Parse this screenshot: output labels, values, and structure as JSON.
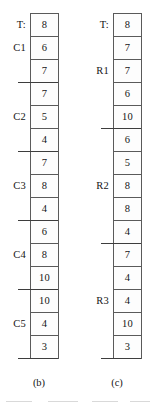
{
  "figure": {
    "panels": [
      {
        "id": "panel-b",
        "caption": "(b)",
        "header_label": "T:",
        "cells": [
          {
            "value": "8",
            "label": "T:",
            "group_end": false
          },
          {
            "value": "6",
            "label": "C1",
            "group_end": false
          },
          {
            "value": "7",
            "label": "",
            "group_end": true
          },
          {
            "value": "7",
            "label": "",
            "group_end": false
          },
          {
            "value": "5",
            "label": "C2",
            "group_end": false
          },
          {
            "value": "4",
            "label": "",
            "group_end": true
          },
          {
            "value": "7",
            "label": "",
            "group_end": false
          },
          {
            "value": "8",
            "label": "C3",
            "group_end": false
          },
          {
            "value": "4",
            "label": "",
            "group_end": true
          },
          {
            "value": "6",
            "label": "",
            "group_end": false
          },
          {
            "value": "8",
            "label": "C4",
            "group_end": false
          },
          {
            "value": "10",
            "label": "",
            "group_end": true
          },
          {
            "value": "10",
            "label": "",
            "group_end": false
          },
          {
            "value": "4",
            "label": "C5",
            "group_end": false
          },
          {
            "value": "3",
            "label": "",
            "group_end": true
          }
        ]
      },
      {
        "id": "panel-c",
        "caption": "(c)",
        "header_label": "T:",
        "cells": [
          {
            "value": "8",
            "label": "T:",
            "group_end": false
          },
          {
            "value": "7",
            "label": "",
            "group_end": false
          },
          {
            "value": "7",
            "label": "R1",
            "group_end": false
          },
          {
            "value": "6",
            "label": "",
            "group_end": false
          },
          {
            "value": "10",
            "label": "",
            "group_end": true
          },
          {
            "value": "6",
            "label": "",
            "group_end": false
          },
          {
            "value": "5",
            "label": "",
            "group_end": false
          },
          {
            "value": "8",
            "label": "R2",
            "group_end": false
          },
          {
            "value": "8",
            "label": "",
            "group_end": false
          },
          {
            "value": "4",
            "label": "",
            "group_end": true
          },
          {
            "value": "7",
            "label": "",
            "group_end": false
          },
          {
            "value": "4",
            "label": "",
            "group_end": false
          },
          {
            "value": "4",
            "label": "R3",
            "group_end": false
          },
          {
            "value": "10",
            "label": "",
            "group_end": false
          },
          {
            "value": "3",
            "label": "",
            "group_end": true
          }
        ]
      }
    ]
  },
  "chart_data": {
    "type": "table",
    "title": "",
    "xlabel": "",
    "ylabel": "",
    "panels": [
      {
        "name": "(b)",
        "column_header": "T:",
        "values": [
          8,
          6,
          7,
          7,
          5,
          4,
          7,
          8,
          4,
          6,
          8,
          10,
          10,
          4,
          3
        ],
        "group_labels": [
          "T:",
          "C1",
          "C2",
          "C3",
          "C4",
          "C5"
        ],
        "group_label_rows": [
          0,
          1,
          4,
          7,
          10,
          13
        ],
        "group_separator_after_rows": [
          2,
          5,
          8,
          11,
          14
        ],
        "groups": [
          {
            "label": "C1",
            "values": [
              6,
              7
            ]
          },
          {
            "label": "C2",
            "values": [
              7,
              5,
              4
            ]
          },
          {
            "label": "C3",
            "values": [
              7,
              8,
              4
            ]
          },
          {
            "label": "C4",
            "values": [
              6,
              8,
              10
            ]
          },
          {
            "label": "C5",
            "values": [
              10,
              4,
              3
            ]
          }
        ]
      },
      {
        "name": "(c)",
        "column_header": "T:",
        "values": [
          8,
          7,
          7,
          6,
          10,
          6,
          5,
          8,
          8,
          4,
          7,
          4,
          4,
          10,
          3
        ],
        "group_labels": [
          "T:",
          "R1",
          "R2",
          "R3"
        ],
        "group_label_rows": [
          0,
          2,
          7,
          12
        ],
        "group_separator_after_rows": [
          4,
          9,
          14
        ],
        "groups": [
          {
            "label": "R1",
            "values": [
              7,
              7,
              6,
              10
            ]
          },
          {
            "label": "R2",
            "values": [
              6,
              5,
              8,
              8,
              4
            ]
          },
          {
            "label": "R3",
            "values": [
              7,
              4,
              4,
              10,
              3
            ]
          }
        ]
      }
    ]
  }
}
